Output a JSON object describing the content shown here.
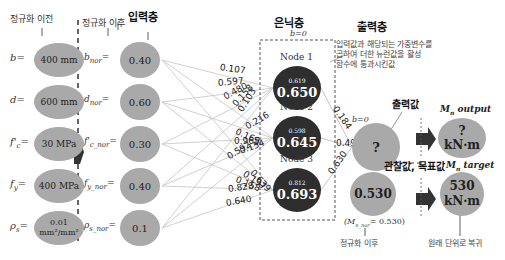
{
  "labels": {
    "before_norm": "정규화 이전",
    "after_norm": "정규화 이후",
    "input_layer": "입력층",
    "hidden_layer": "은닉층",
    "output_layer": "출력층",
    "bias_hidden": "b=0",
    "bias_output": "b=0",
    "activation_note": [
      "입력값과 해당되는 가중변수를",
      "곱하여 더한 뉴런값을 활성",
      "함수에 통과시킨값"
    ],
    "output_value": "출력값",
    "observed_target": "관찰값, 목표값",
    "after_norm_bottom": "정규화 이후",
    "restore_units": "원래 단위로 복귀",
    "mn_output": "M",
    "mn_output_sub": "n",
    "mn_output_word": "output",
    "mn_target_word": "target",
    "mn_nor_note": "(M",
    "mn_nor_note_sub": "n_nor",
    "mn_nor_note_val": "= 0.530)"
  },
  "raw_inputs": [
    {
      "var": "b",
      "sub": "",
      "value": "400 mm"
    },
    {
      "var": "d",
      "sub": "",
      "value": "600 mm"
    },
    {
      "var": "f'",
      "sub": "c",
      "value": "30 MPa"
    },
    {
      "var": "f",
      "sub": "y",
      "value": "400 MPa"
    },
    {
      "var": "ρ",
      "sub": "s",
      "value_line1": "0.01",
      "value_line2": "mm²/mm²"
    }
  ],
  "norm_inputs": [
    {
      "var": "b",
      "sub": "nor",
      "value": "0.40"
    },
    {
      "var": "d",
      "sub": "nor",
      "value": "0.60"
    },
    {
      "var": "f'",
      "sub": "c_nor",
      "value": "0.30"
    },
    {
      "var": "f",
      "sub": "y_nor",
      "value": "0.40"
    },
    {
      "var": "ρ",
      "sub": "s_nor",
      "value": "0.1"
    }
  ],
  "hidden_nodes": [
    {
      "name": "Node 1",
      "pre": "0.619",
      "value": "0.650"
    },
    {
      "name": "Node 2",
      "pre": "0.598",
      "value": "0.645"
    },
    {
      "name": "Node 3",
      "pre": "0.812",
      "value": "0.693"
    }
  ],
  "input_weights": [
    "0.107",
    "0.597",
    "0.480",
    "0.158",
    "0.103",
    "0.216",
    "0.169",
    "0.965",
    "0.154",
    "0.592",
    "0.639",
    "0.197",
    "0.158",
    "0.828",
    "0.640"
  ],
  "output_weights": [
    "0.184",
    "0.493",
    "0.630"
  ],
  "output_node": {
    "value": "?"
  },
  "output_display": {
    "line1": "?",
    "line2": "kN·m"
  },
  "target_node": {
    "value": "0.530"
  },
  "target_display": {
    "line1": "530",
    "line2": "kN·m"
  },
  "colors": {
    "light_node": "#a9a9a9",
    "dark_node": "#2e2e2e",
    "edge": "#c4c4c4"
  }
}
